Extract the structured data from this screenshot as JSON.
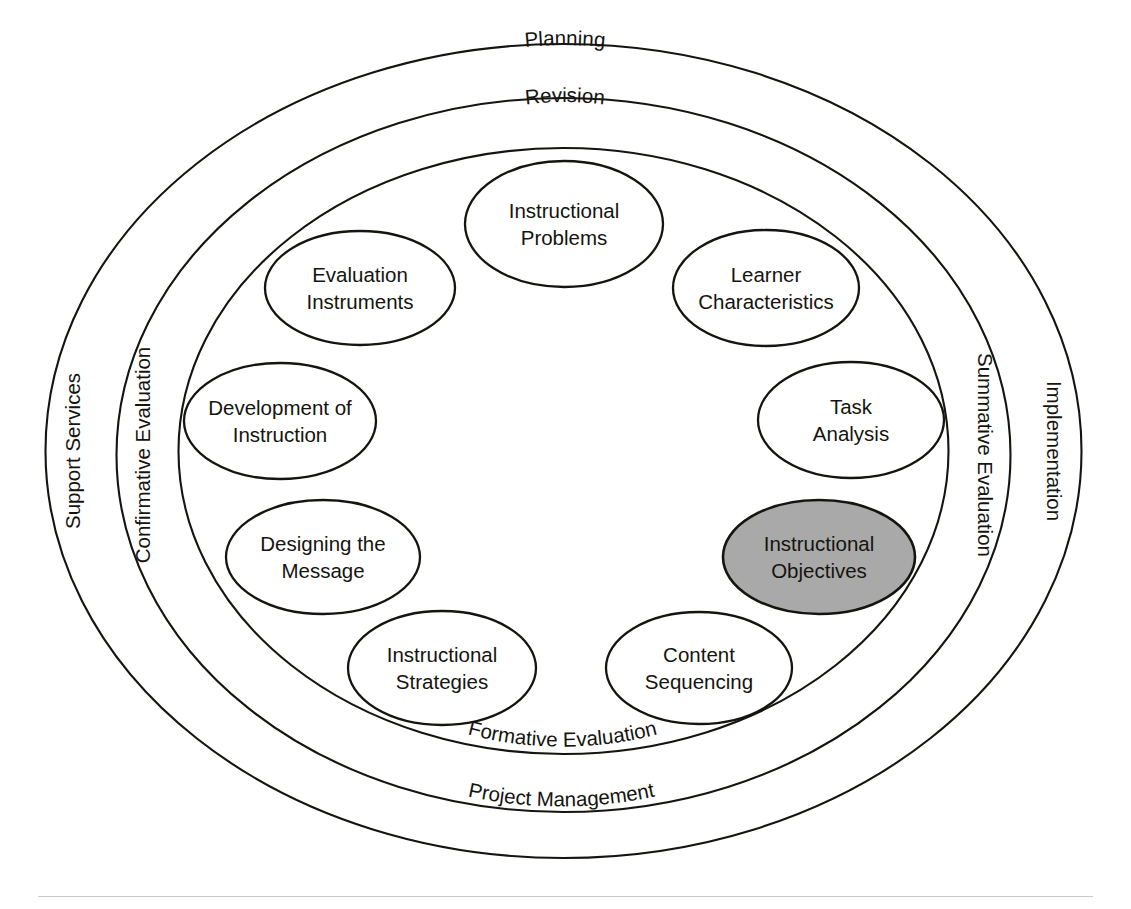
{
  "diagram": {
    "type": "concentric-oval-model",
    "colors": {
      "stroke": "#15140f",
      "background": "#ffffff",
      "highlight_fill": "#a9a9a9",
      "node_fill": "#ffffff"
    },
    "rings": [
      {
        "id": "ring-outer",
        "index": 0,
        "labels": [
          {
            "id": "planning",
            "text": "Planning",
            "position": "top"
          },
          {
            "id": "support-services",
            "text": "Support Services",
            "position": "left",
            "rotation": -90
          },
          {
            "id": "implementation",
            "text": "Implementation",
            "position": "right",
            "rotation": 90
          },
          {
            "id": "project-management",
            "text": "Project Management",
            "position": "bottom"
          }
        ]
      },
      {
        "id": "ring-middle",
        "index": 1,
        "labels": [
          {
            "id": "revision",
            "text": "Revision",
            "position": "top"
          },
          {
            "id": "confirmative-evaluation",
            "text": "Confirmative Evaluation",
            "position": "left",
            "rotation": -90
          },
          {
            "id": "summative-evaluation",
            "text": "Summative Evaluation",
            "position": "right",
            "rotation": 90
          },
          {
            "id": "formative-evaluation",
            "text": "Formative Evaluation",
            "position": "bottom"
          }
        ]
      },
      {
        "id": "ring-inner",
        "index": 2,
        "labels": []
      }
    ],
    "nodes": [
      {
        "id": "instructional-problems",
        "line1": "Instructional",
        "line2": "Problems",
        "highlighted": false
      },
      {
        "id": "learner-characteristics",
        "line1": "Learner",
        "line2": "Characteristics",
        "highlighted": false
      },
      {
        "id": "task-analysis",
        "line1": "Task",
        "line2": "Analysis",
        "highlighted": false
      },
      {
        "id": "instructional-objectives",
        "line1": "Instructional",
        "line2": "Objectives",
        "highlighted": true
      },
      {
        "id": "content-sequencing",
        "line1": "Content",
        "line2": "Sequencing",
        "highlighted": false
      },
      {
        "id": "instructional-strategies",
        "line1": "Instructional",
        "line2": "Strategies",
        "highlighted": false
      },
      {
        "id": "designing-the-message",
        "line1": "Designing the",
        "line2": "Message",
        "highlighted": false
      },
      {
        "id": "development-of-instruction",
        "line1": "Development of",
        "line2": "Instruction",
        "highlighted": false
      },
      {
        "id": "evaluation-instruments",
        "line1": "Evaluation",
        "line2": "Instruments",
        "highlighted": false
      }
    ]
  }
}
